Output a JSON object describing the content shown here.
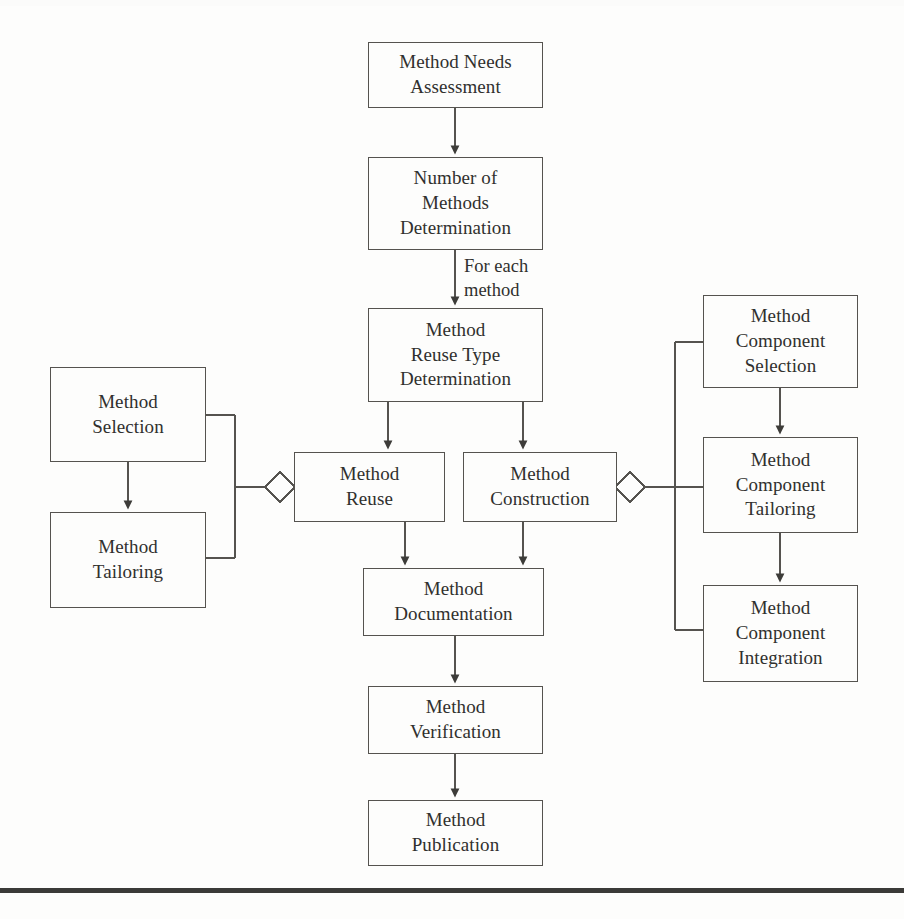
{
  "diagram": {
    "type": "flowchart",
    "canvas": {
      "width": 904,
      "height": 919
    },
    "colors": {
      "background": "#fdfdfc",
      "node_border": "#55534f",
      "node_fill": "#fdfdfc",
      "text": "#30302e",
      "connector": "#55534f",
      "footer_rule": "#3b3a38"
    },
    "nodes": [
      {
        "id": "needs",
        "label": "Method Needs\nAssessment",
        "x": 368,
        "y": 42,
        "w": 175,
        "h": 66
      },
      {
        "id": "number",
        "label": "Number of\nMethods\nDetermination",
        "x": 368,
        "y": 157,
        "w": 175,
        "h": 93
      },
      {
        "id": "reusetype",
        "label": "Method\nReuse Type\nDetermination",
        "x": 368,
        "y": 308,
        "w": 175,
        "h": 94
      },
      {
        "id": "reuse",
        "label": "Method\nReuse",
        "x": 294,
        "y": 452,
        "w": 151,
        "h": 70
      },
      {
        "id": "construction",
        "label": "Method\nConstruction",
        "x": 463,
        "y": 452,
        "w": 154,
        "h": 70
      },
      {
        "id": "documentation",
        "label": "Method\nDocumentation",
        "x": 363,
        "y": 568,
        "w": 181,
        "h": 68
      },
      {
        "id": "verification",
        "label": "Method\nVerification",
        "x": 368,
        "y": 686,
        "w": 175,
        "h": 68
      },
      {
        "id": "publication",
        "label": "Method\nPublication",
        "x": 368,
        "y": 800,
        "w": 175,
        "h": 66
      },
      {
        "id": "selection",
        "label": "Method\nSelection",
        "x": 50,
        "y": 367,
        "w": 156,
        "h": 95
      },
      {
        "id": "tailoring",
        "label": "Method\nTailoring",
        "x": 50,
        "y": 512,
        "w": 156,
        "h": 96
      },
      {
        "id": "compselect",
        "label": "Method\nComponent\nSelection",
        "x": 703,
        "y": 295,
        "w": 155,
        "h": 93
      },
      {
        "id": "comptailor",
        "label": "Method\nComponent\nTailoring",
        "x": 703,
        "y": 437,
        "w": 155,
        "h": 96
      },
      {
        "id": "compintegr",
        "label": "Method\nComponent\nIntegration",
        "x": 703,
        "y": 585,
        "w": 155,
        "h": 97
      }
    ],
    "edge_labels": [
      {
        "id": "for-each-method",
        "text": "For each\nmethod",
        "x": 464,
        "y": 255
      }
    ],
    "edges": [
      {
        "from": "needs",
        "to": "number",
        "kind": "arrow"
      },
      {
        "from": "number",
        "to": "reusetype",
        "kind": "arrow",
        "label": "For each method"
      },
      {
        "from": "reusetype",
        "to": "reuse",
        "kind": "arrow"
      },
      {
        "from": "reusetype",
        "to": "construction",
        "kind": "arrow"
      },
      {
        "from": "reuse",
        "to": "documentation",
        "kind": "arrow"
      },
      {
        "from": "construction",
        "to": "documentation",
        "kind": "arrow"
      },
      {
        "from": "documentation",
        "to": "verification",
        "kind": "arrow"
      },
      {
        "from": "verification",
        "to": "publication",
        "kind": "arrow"
      },
      {
        "from": "selection",
        "to": "tailoring",
        "kind": "arrow"
      },
      {
        "from": "compselect",
        "to": "comptailor",
        "kind": "arrow"
      },
      {
        "from": "comptailor",
        "to": "compintegr",
        "kind": "arrow"
      },
      {
        "from": "reuse",
        "to": "selection",
        "kind": "aggregation",
        "note": "diamond on Method Reuse side, bracket to Method Selection and Method Tailoring"
      },
      {
        "from": "construction",
        "to": "compselect",
        "kind": "aggregation",
        "note": "diamond on Method Construction side, bracket to Method Component Selection, Tailoring and Integration"
      }
    ],
    "diamonds": [
      {
        "id": "left-aggregation-diamond",
        "cx": 280,
        "cy": 487,
        "r": 15
      },
      {
        "id": "right-aggregation-diamond",
        "cx": 630,
        "cy": 487,
        "r": 15
      }
    ],
    "footer_rule": {
      "x": 0,
      "y": 888,
      "w": 904,
      "h": 5
    }
  }
}
